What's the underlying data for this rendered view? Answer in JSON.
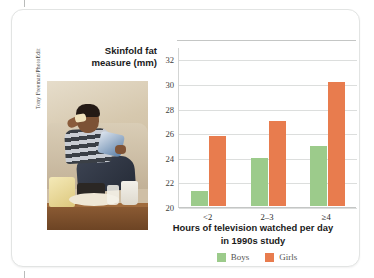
{
  "figure": {
    "photo_credit": "Tony Freeman/PhotoEdit",
    "photo_alt": "teen-eating-snacks-photo"
  },
  "chart_data": {
    "type": "bar",
    "title": "",
    "xlabel": "Hours of television watched per day in 1990s study",
    "xlabel_line1": "Hours of television watched per day",
    "xlabel_line2": "in 1990s study",
    "ylabel": "Skinfold fat measure (mm)",
    "ylabel_line1": "Skinfold fat",
    "ylabel_line2": "measure (mm)",
    "categories": [
      "<2",
      "2–3",
      "≥4"
    ],
    "series": [
      {
        "name": "Boys",
        "color": "#9ccb8b",
        "values": [
          21.2,
          23.9,
          24.9
        ]
      },
      {
        "name": "Girls",
        "color": "#e87c4e",
        "values": [
          25.7,
          26.9,
          30.1
        ]
      }
    ],
    "ylim": [
      20,
      33
    ],
    "yticks": [
      20,
      22,
      24,
      26,
      28,
      30,
      32
    ],
    "grid": true,
    "legend_position": "bottom"
  }
}
